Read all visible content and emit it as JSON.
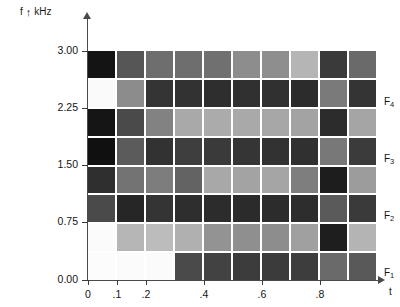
{
  "axes": {
    "y_label_symbol": "f",
    "y_label_arrow": "↑",
    "y_label_unit": "kHz",
    "x_label_symbol": "t",
    "y_ticks": [
      {
        "label": "3.00",
        "value": 3.0,
        "y": 51
      },
      {
        "label": "2.25",
        "value": 2.25,
        "y": 108
      },
      {
        "label": "1.50",
        "value": 1.5,
        "y": 165
      },
      {
        "label": "0.75",
        "value": 0.75,
        "y": 222
      },
      {
        "label": "0.00",
        "value": 0.0,
        "y": 280
      }
    ],
    "x_ticks": [
      {
        "label": "0",
        "value": 0.0,
        "x": 88
      },
      {
        "label": ".1",
        "value": 0.1,
        "x": 117
      },
      {
        "label": ".2",
        "value": 0.2,
        "x": 146
      },
      {
        "label": ".4",
        "value": 0.4,
        "x": 204
      },
      {
        "label": ".6",
        "value": 0.6,
        "x": 262
      },
      {
        "label": ".8",
        "value": 0.8,
        "x": 320
      }
    ]
  },
  "annotations": [
    {
      "name": "formant-4",
      "label": "F",
      "sub": "4",
      "y": 103
    },
    {
      "name": "formant-3",
      "label": "F",
      "sub": "3",
      "y": 160
    },
    {
      "name": "formant-2",
      "label": "F",
      "sub": "2",
      "y": 217
    },
    {
      "name": "formant-1",
      "label": "F",
      "sub": "1",
      "y": 274
    }
  ],
  "chart_data": {
    "type": "heatmap",
    "title": "",
    "xlabel": "t",
    "ylabel": "f",
    "yunit": "kHz",
    "xlim": [
      0.0,
      1.0
    ],
    "ylim": [
      0.0,
      3.0
    ],
    "grid": false,
    "colormap": "grayscale",
    "cell_gap_color": "#ffffff",
    "n_cols": 10,
    "n_rows": 8,
    "x_bin_edges": [
      0.0,
      0.1,
      0.2,
      0.3,
      0.4,
      0.5,
      0.6,
      0.7,
      0.8,
      0.9,
      1.0
    ],
    "y_bin_edges": [
      0.0,
      0.375,
      0.75,
      1.125,
      1.5,
      1.875,
      2.25,
      2.625,
      3.0
    ],
    "row_labels_top_to_bottom": [
      "2.625-3.00",
      "2.25-2.625",
      "1.875-2.25",
      "1.50-1.875",
      "1.125-1.50",
      "0.75-1.125",
      "0.375-0.75",
      "0.00-0.375"
    ],
    "values_top_to_bottom": [
      [
        "#141414",
        "#565656",
        "#6e6e6e",
        "#6e6e6e",
        "#707070",
        "#8d8d8d",
        "#8e8e8e",
        "#b5b5b5",
        "#3a3a3a",
        "#6a6a6a"
      ],
      [
        "#fafafa",
        "#8c8c8c",
        "#343434",
        "#323232",
        "#2e2e2e",
        "#303030",
        "#303030",
        "#2c2c2c",
        "#7a7a7a",
        "#343434"
      ],
      [
        "#151515",
        "#4a4a4a",
        "#828282",
        "#a9a9a9",
        "#ababab",
        "#a9a9a9",
        "#a7a7a7",
        "#a3a3a3",
        "#2c2c2c",
        "#a5a5a5"
      ],
      [
        "#101010",
        "#5b5b5b",
        "#323232",
        "#3e3e3e",
        "#3a3a3a",
        "#353535",
        "#323232",
        "#303030",
        "#787878",
        "#3b3b3b"
      ],
      [
        "#2f2f2f",
        "#737373",
        "#7d7d7d",
        "#636363",
        "#a8a8a8",
        "#a3a3a3",
        "#a5a5a5",
        "#7e7e7e",
        "#1d1d1d",
        "#9c9c9c"
      ],
      [
        "#4a4a4a",
        "#262626",
        "#343434",
        "#2e2e2e",
        "#2c2c2c",
        "#2b2b2b",
        "#2c2c2c",
        "#2d2d2d",
        "#5a5a5a",
        "#3a3a3a"
      ],
      [
        "#fbfbfb",
        "#b6b6b6",
        "#bcbcbc",
        "#b0b0b0",
        "#939393",
        "#8f8f8f",
        "#8d8d8d",
        "#a0a0a0",
        "#1e1e1e",
        "#b4b4b4"
      ],
      [
        "#fcfcfc",
        "#fbfbfb",
        "#fbfbfb",
        "#4a4a4a",
        "#424242",
        "#3c3c3c",
        "#3b3b3b",
        "#3d3d3d",
        "#6a6a6a",
        "#595959"
      ]
    ]
  }
}
